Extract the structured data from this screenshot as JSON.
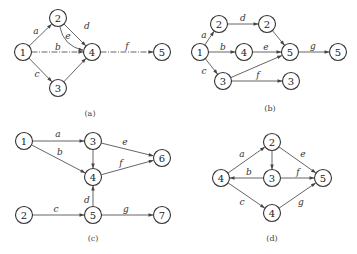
{
  "diagrams": [
    {
      "id": "a",
      "caption": "(a)",
      "caption_pos": [
        90,
        113
      ],
      "nodes": [
        {
          "key": "n1",
          "label": "1",
          "x": 23,
          "y": 52
        },
        {
          "key": "n2",
          "label": "2",
          "x": 58,
          "y": 18
        },
        {
          "key": "n4",
          "label": "4",
          "x": 92,
          "y": 52
        },
        {
          "key": "n3",
          "label": "3",
          "x": 58,
          "y": 88
        },
        {
          "key": "n5",
          "label": "5",
          "x": 162,
          "y": 52
        }
      ],
      "edges": [
        {
          "from": "n1",
          "to": "n2",
          "label": "a",
          "lx": 36,
          "ly": 31
        },
        {
          "from": "n1",
          "to": "n4",
          "label": "b",
          "lx": 58,
          "ly": 47,
          "dashed": true
        },
        {
          "from": "n1",
          "to": "n3",
          "label": "c",
          "lx": 37,
          "ly": 74
        },
        {
          "from": "n2",
          "to": "n4",
          "label": "d",
          "lx": 87,
          "ly": 26,
          "curve": 10
        },
        {
          "from": "n2",
          "to": "n4",
          "label": "e",
          "lx": 68,
          "ly": 36
        },
        {
          "from": "n3",
          "to": "n4",
          "label": "",
          "lx": 0,
          "ly": 0
        },
        {
          "from": "n4",
          "to": "n5",
          "label": "f",
          "lx": 127,
          "ly": 46,
          "dashed": true
        }
      ]
    },
    {
      "id": "b",
      "caption": "(b)",
      "caption_pos": [
        270,
        108
      ],
      "nodes": [
        {
          "key": "n1",
          "label": "1",
          "x": 200,
          "y": 52
        },
        {
          "key": "n2a",
          "label": "2",
          "x": 219,
          "y": 24
        },
        {
          "key": "n2b",
          "label": "2",
          "x": 267,
          "y": 24
        },
        {
          "key": "n4",
          "label": "4",
          "x": 244,
          "y": 52
        },
        {
          "key": "n5a",
          "label": "5",
          "x": 290,
          "y": 52
        },
        {
          "key": "n5b",
          "label": "5",
          "x": 338,
          "y": 52
        },
        {
          "key": "n3a",
          "label": "3",
          "x": 223,
          "y": 81
        },
        {
          "key": "n3b",
          "label": "3",
          "x": 291,
          "y": 81
        }
      ],
      "edges": [
        {
          "from": "n1",
          "to": "n2a",
          "label": "a",
          "lx": 204,
          "ly": 35
        },
        {
          "from": "n2a",
          "to": "n2b",
          "label": "d",
          "lx": 243,
          "ly": 18
        },
        {
          "from": "n2b",
          "to": "n5a",
          "label": "",
          "lx": 0,
          "ly": 0
        },
        {
          "from": "n1",
          "to": "n4",
          "label": "b",
          "lx": 223,
          "ly": 47
        },
        {
          "from": "n4",
          "to": "n5a",
          "label": "e",
          "lx": 266,
          "ly": 47
        },
        {
          "from": "n1",
          "to": "n3a",
          "label": "c",
          "lx": 204,
          "ly": 71
        },
        {
          "from": "n3a",
          "to": "n5a",
          "label": "",
          "lx": 0,
          "ly": 0
        },
        {
          "from": "n3a",
          "to": "n3b",
          "label": "f",
          "lx": 258,
          "ly": 75
        },
        {
          "from": "n5a",
          "to": "n5b",
          "label": "g",
          "lx": 313,
          "ly": 46
        }
      ]
    },
    {
      "id": "c",
      "caption": "(c)",
      "caption_pos": [
        93,
        238
      ],
      "nodes": [
        {
          "key": "n1",
          "label": "1",
          "x": 24,
          "y": 141
        },
        {
          "key": "n3",
          "label": "3",
          "x": 93,
          "y": 141
        },
        {
          "key": "n4",
          "label": "4",
          "x": 93,
          "y": 177
        },
        {
          "key": "n6",
          "label": "6",
          "x": 162,
          "y": 158
        },
        {
          "key": "n2",
          "label": "2",
          "x": 24,
          "y": 215
        },
        {
          "key": "n5",
          "label": "5",
          "x": 93,
          "y": 215
        },
        {
          "key": "n7",
          "label": "7",
          "x": 162,
          "y": 215
        }
      ],
      "edges": [
        {
          "from": "n1",
          "to": "n3",
          "label": "a",
          "lx": 58,
          "ly": 134
        },
        {
          "from": "n1",
          "to": "n4",
          "label": "b",
          "lx": 60,
          "ly": 152
        },
        {
          "from": "n3",
          "to": "n4",
          "label": "",
          "lx": 0,
          "ly": 0
        },
        {
          "from": "n3",
          "to": "n6",
          "label": "e",
          "lx": 125,
          "ly": 142
        },
        {
          "from": "n4",
          "to": "n6",
          "label": "f",
          "lx": 121,
          "ly": 163
        },
        {
          "from": "n5",
          "to": "n4",
          "label": "d",
          "lx": 87,
          "ly": 200
        },
        {
          "from": "n2",
          "to": "n5",
          "label": "c",
          "lx": 56,
          "ly": 209
        },
        {
          "from": "n5",
          "to": "n7",
          "label": "g",
          "lx": 126,
          "ly": 209
        }
      ]
    },
    {
      "id": "d",
      "caption": "(d)",
      "caption_pos": [
        272,
        238
      ],
      "nodes": [
        {
          "key": "n4a",
          "label": "4",
          "x": 221,
          "y": 178
        },
        {
          "key": "n2",
          "label": "2",
          "x": 272,
          "y": 142
        },
        {
          "key": "n3",
          "label": "3",
          "x": 272,
          "y": 178
        },
        {
          "key": "n5",
          "label": "5",
          "x": 323,
          "y": 178
        },
        {
          "key": "n4b",
          "label": "4",
          "x": 272,
          "y": 213
        }
      ],
      "edges": [
        {
          "from": "n4a",
          "to": "n2",
          "label": "a",
          "lx": 242,
          "ly": 154
        },
        {
          "from": "n3",
          "to": "n4a",
          "label": "b",
          "lx": 249,
          "ly": 172
        },
        {
          "from": "n4a",
          "to": "n4b",
          "label": "c",
          "lx": 242,
          "ly": 202
        },
        {
          "from": "n2",
          "to": "n3",
          "label": "",
          "lx": 0,
          "ly": 0
        },
        {
          "from": "n2",
          "to": "n5",
          "label": "e",
          "lx": 303,
          "ly": 154
        },
        {
          "from": "n3",
          "to": "n5",
          "label": "f",
          "lx": 298,
          "ly": 172
        },
        {
          "from": "n4b",
          "to": "n5",
          "label": "g",
          "lx": 301,
          "ly": 202
        }
      ]
    }
  ],
  "style": {
    "node_radius": 8.5,
    "stroke_color": "#555555",
    "node_stroke": "#333333"
  }
}
